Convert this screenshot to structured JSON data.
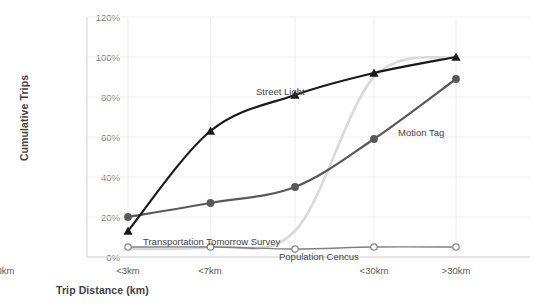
{
  "chart_data": {
    "type": "line",
    "title": "",
    "xlabel": "Trip Distance (km)",
    "ylabel": "Cumulative Trips",
    "categories": [
      "<3km",
      "<7km",
      "<10km",
      "<30km",
      ">30km"
    ],
    "ylim": [
      0,
      120
    ],
    "yticks": [
      0,
      20,
      40,
      60,
      80,
      100,
      120
    ],
    "ytick_labels": [
      "0%",
      "20%",
      "40%",
      "60%",
      "80%",
      "100%",
      "120%"
    ],
    "grid": true,
    "legend": "inline-labels",
    "series": [
      {
        "name": "Street Light",
        "values": [
          13,
          63,
          81,
          92,
          100
        ],
        "color": "#1a1a1a",
        "marker": "triangle",
        "label_x": 256,
        "label_y": 92
      },
      {
        "name": "Motion Tag",
        "values": [
          20,
          27,
          35,
          59,
          89
        ],
        "color": "#595959",
        "marker": "circle",
        "label_x": 398,
        "label_y": 133
      },
      {
        "name": "Transportation Tomorrow Survey",
        "values": [
          5,
          5,
          4,
          5,
          5
        ],
        "color": "#808080",
        "marker": "circle-open",
        "label_x": 143,
        "label_y": 243
      },
      {
        "name": "Population Cencus",
        "values": [
          4,
          5,
          13,
          90,
          100
        ],
        "color": "#d9d9d9",
        "marker": "none",
        "label_x": 279,
        "label_y": 259
      }
    ]
  },
  "axis": {
    "ytick_0": "0%",
    "ytick_1": "20%",
    "ytick_2": "40%",
    "ytick_3": "60%",
    "ytick_4": "80%",
    "ytick_5": "100%",
    "ytick_6": "120%",
    "xtick_0": "<3km",
    "xtick_1": "<7km",
    "xtick_2": "<10km",
    "xtick_3": "<30km",
    "xtick_4": ">30km",
    "y_title": "Cumulative Trips",
    "x_title": "Trip Distance (km)"
  },
  "labels": {
    "street_light": "Street Light",
    "motion_tag": "Motion Tag",
    "tts": "Transportation Tomorrow Survey",
    "census": "Population Cencus"
  },
  "colors": {
    "street_light": "#1a1a1a",
    "motion_tag": "#595959",
    "tts": "#808080",
    "census": "#d9d9d9",
    "grid": "#eeeeee",
    "axis": "#d4d4d4",
    "tick_text": "#7c7c7c",
    "title_text": "#3f3f3f"
  }
}
